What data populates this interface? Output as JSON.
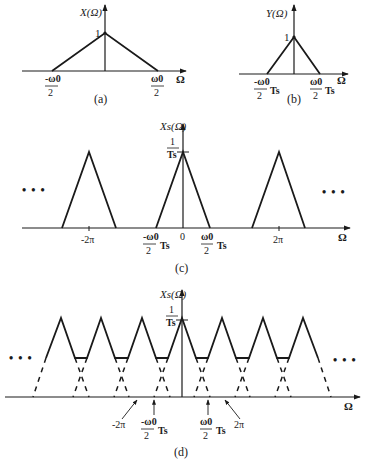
{
  "figure": {
    "panels": [
      {
        "id": "a",
        "caption": "(a)",
        "ylabel": "X(Ω)",
        "peak_label": "1",
        "xlabel": "Ω",
        "ticks": [
          {
            "num": "-ω0",
            "den": "2"
          },
          {
            "num": "ω0",
            "den": "2"
          }
        ]
      },
      {
        "id": "b",
        "caption": "(b)",
        "ylabel": "Y(Ω)",
        "peak_label": "1",
        "xlabel": "Ω",
        "ticks": [
          {
            "num": "-ω0",
            "den": "2",
            "suffix": "Ts"
          },
          {
            "num": "ω0",
            "den": "2",
            "suffix": "Ts"
          }
        ]
      },
      {
        "id": "c",
        "caption": "(c)",
        "ylabel": "Xs(Ω)",
        "peak_num": "1",
        "peak_den": "Ts",
        "xlabel": "Ω",
        "ellipsis": "• • •",
        "ticks": [
          {
            "label": "-2π"
          },
          {
            "num": "-ω0",
            "den": "2",
            "suffix": "Ts"
          },
          {
            "label": "0"
          },
          {
            "num": "ω0",
            "den": "2",
            "suffix": "Ts"
          },
          {
            "label": "2π"
          }
        ]
      },
      {
        "id": "d",
        "caption": "(d)",
        "ylabel": "Xs(Ω)",
        "peak_num": "1",
        "peak_den": "Ts",
        "xlabel": "Ω",
        "ellipsis": "• • •",
        "ticks": [
          {
            "label": "-2π"
          },
          {
            "num": "-ω0",
            "den": "2",
            "suffix": "Ts"
          },
          {
            "num": "ω0",
            "den": "2",
            "suffix": "Ts"
          },
          {
            "label": "2π"
          }
        ]
      }
    ]
  }
}
